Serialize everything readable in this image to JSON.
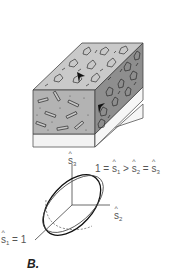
{
  "figure": {
    "panel_label": "B.",
    "block": {
      "top_face_color": "#c8c8c8",
      "front_face_color": "#b4b4b4",
      "right_face_color": "#8c8c8c",
      "base_strip_color": "#f2f2f2",
      "top_texture": "grains",
      "front_texture": "rods",
      "right_texture": "grains",
      "arrow_markers": 2
    },
    "ellipsoid": {
      "axis_s3_label": "s3",
      "axis_s2_label": "s2",
      "axis_s1_label": "s1 = 1",
      "relation_label": "1 = s1 > s2 = s3"
    },
    "labels": {
      "s3_base": "s",
      "s3_sub": "3",
      "s2_base": "s",
      "s2_sub": "2",
      "s1_base": "s",
      "s1_sub": "1",
      "s1_suffix": " = 1",
      "rel_prefix": "1 = ",
      "rel_s1_base": "s",
      "rel_s1_sub": "1",
      "rel_gt": " > ",
      "rel_s2_base": "s",
      "rel_s2_sub": "2",
      "rel_eq": " = ",
      "rel_s3_base": "s",
      "rel_s3_sub": "3"
    }
  }
}
